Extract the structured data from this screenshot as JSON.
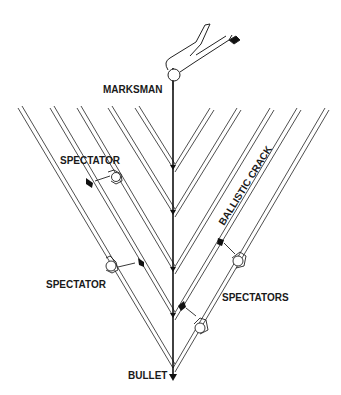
{
  "diagram": {
    "labels": {
      "marksman": "MARKSMAN",
      "spectator_upper": "SPECTATOR",
      "spectator_lower": "SPECTATOR",
      "spectators": "SPECTATORS",
      "ballistic_crack": "BALLISTIC CRACK",
      "bullet": "BULLET"
    },
    "trajectory": {
      "x": 173,
      "y_start": 68,
      "y_end": 380
    },
    "wavefronts": [
      {
        "apex_y": 168,
        "left_top": [
          135,
          108
        ],
        "right_top": [
          210,
          108
        ]
      },
      {
        "apex_y": 213,
        "left_top": [
          108,
          108
        ],
        "right_top": [
          237,
          108
        ]
      },
      {
        "apex_y": 270,
        "left_top": [
          77,
          108
        ],
        "right_top": [
          270,
          108
        ]
      },
      {
        "apex_y": 316,
        "left_top": [
          50,
          108
        ],
        "right_top": [
          297,
          108
        ]
      },
      {
        "apex_y": 368,
        "left_top": [
          18,
          108
        ],
        "right_top": [
          325,
          108
        ]
      }
    ],
    "colors": {
      "line": "#1a1a1a",
      "background": "#ffffff"
    }
  }
}
